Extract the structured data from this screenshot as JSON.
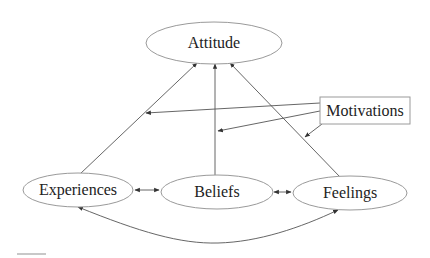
{
  "diagram": {
    "nodes": {
      "attitude": {
        "label": "Attitude",
        "shape": "ellipse"
      },
      "experiences": {
        "label": "Experiences",
        "shape": "ellipse"
      },
      "beliefs": {
        "label": "Beliefs",
        "shape": "ellipse"
      },
      "feelings": {
        "label": "Feelings",
        "shape": "ellipse"
      },
      "motivations": {
        "label": "Motivations",
        "shape": "rectangle"
      }
    },
    "edges": [
      {
        "from": "Experiences",
        "to": "Attitude",
        "type": "directed"
      },
      {
        "from": "Beliefs",
        "to": "Attitude",
        "type": "directed"
      },
      {
        "from": "Feelings",
        "to": "Attitude",
        "type": "directed"
      },
      {
        "from": "Experiences",
        "to": "Beliefs",
        "type": "bidirectional"
      },
      {
        "from": "Beliefs",
        "to": "Feelings",
        "type": "bidirectional"
      },
      {
        "from": "Experiences",
        "to": "Feelings",
        "type": "bidirectional",
        "curve": "below"
      },
      {
        "from": "Motivations",
        "to": "Experiences→Attitude edge",
        "type": "moderating"
      },
      {
        "from": "Motivations",
        "to": "Beliefs→Attitude edge",
        "type": "moderating"
      },
      {
        "from": "Motivations",
        "to": "Feelings→Attitude edge",
        "type": "moderating"
      }
    ],
    "colors": {
      "node_stroke": "#9a9a9a",
      "edge": "#555555",
      "text": "#222222",
      "background": "#ffffff"
    }
  }
}
